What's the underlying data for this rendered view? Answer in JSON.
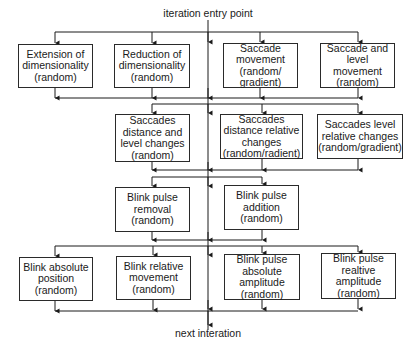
{
  "diagram": {
    "entry_label": "iteration entry point",
    "exit_label": "next interation",
    "line_color": "#1a1a1a",
    "stages": [
      {
        "name": "stage-1",
        "boxes": [
          {
            "text": "Extension of\ndimensionality\n(random)",
            "x": 18,
            "y": 44,
            "w": 75,
            "h": 44
          },
          {
            "text": "Reduction of\ndimensionality\n(random)",
            "x": 114,
            "y": 44,
            "w": 76,
            "h": 44
          },
          {
            "text": "Saccade\nmovement\n(random/\ngradient)",
            "x": 223,
            "y": 43,
            "w": 75,
            "h": 45
          },
          {
            "text": "Saccade  and\nlevel\nmovement\n(random)",
            "x": 320,
            "y": 43,
            "w": 75,
            "h": 45
          }
        ]
      },
      {
        "name": "stage-2",
        "boxes": [
          {
            "text": "Saccades\ndistance and\nlevel changes\n(random)",
            "x": 115,
            "y": 114,
            "w": 75,
            "h": 48
          },
          {
            "text": "Saccades\ndistance relative\nchanges\n(random/radient)",
            "x": 220,
            "y": 114,
            "w": 83,
            "h": 45
          },
          {
            "text": "Saccades level\nrelative changes\n(random/gradient)",
            "x": 317,
            "y": 114,
            "w": 86,
            "h": 45
          }
        ]
      },
      {
        "name": "stage-3",
        "boxes": [
          {
            "text": "Blink pulse\nremoval\n(random)",
            "x": 115,
            "y": 187,
            "w": 75,
            "h": 45
          },
          {
            "text": "Blink pulse\naddition\n(random)",
            "x": 224,
            "y": 185,
            "w": 75,
            "h": 45
          }
        ]
      },
      {
        "name": "stage-4",
        "boxes": [
          {
            "text": "Blink absolute\nposition\n(random)",
            "x": 19,
            "y": 257,
            "w": 74,
            "h": 44
          },
          {
            "text": "Blink relative\nmovement\n(random)",
            "x": 116,
            "y": 256,
            "w": 75,
            "h": 44
          },
          {
            "text": "Blink pulse\nabsolute\namplitude\n(random)",
            "x": 224,
            "y": 254,
            "w": 76,
            "h": 46
          },
          {
            "text": "Blink pulse\nrealtive\namplitude\n(random)",
            "x": 321,
            "y": 253,
            "w": 75,
            "h": 46
          }
        ]
      }
    ]
  }
}
